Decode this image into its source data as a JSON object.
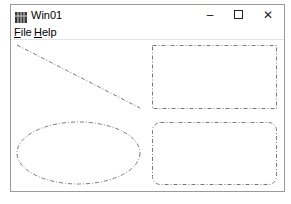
{
  "window": {
    "title": "Win01",
    "icon": "app-grid-icon",
    "controls": {
      "minimize": "–",
      "maximize": "☐",
      "close": "✕"
    }
  },
  "menu": {
    "items": [
      {
        "label_accel": "F",
        "label_rest": "ile"
      },
      {
        "label_accel": "H",
        "label_rest": "elp"
      }
    ]
  },
  "canvas": {
    "stroke_color": "#7a7a7a",
    "stroke_style": "dash-dot",
    "shapes": [
      "line",
      "rectangle",
      "ellipse",
      "rounded-rectangle"
    ]
  }
}
